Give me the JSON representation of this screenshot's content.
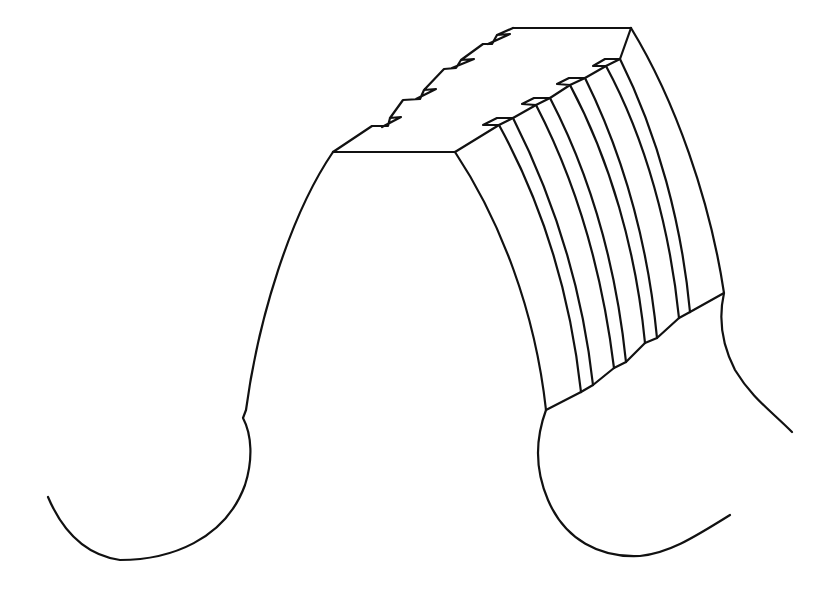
{
  "figure": {
    "line_color": "#111111",
    "background": "#ffffff",
    "groove_count": 5,
    "notch_count": 4
  }
}
